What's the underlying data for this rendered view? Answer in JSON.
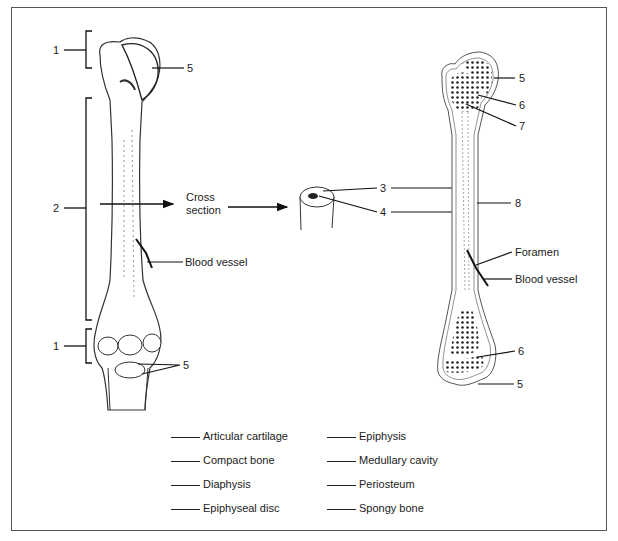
{
  "figure": {
    "left_bone": {
      "labels": {
        "proximal_region": "1",
        "shaft_region": "2",
        "distal_region": "1",
        "cartilage_top": "5",
        "cartilage_bottom": "5",
        "cross_section": "Cross\nsection",
        "cross_section_line1": "Cross",
        "cross_section_line2": "section",
        "blood_vessel": "Blood vessel"
      }
    },
    "cross_section": {
      "labels": {
        "outer": "3",
        "inner": "4"
      }
    },
    "right_bone": {
      "labels": {
        "top_cartilage": "5",
        "top_disc": "6",
        "top_spongy": "7",
        "periosteum": "8",
        "foramen": "Foramen",
        "blood_vessel": "Blood vessel",
        "bottom_disc": "6",
        "bottom_cartilage": "5"
      }
    }
  },
  "key": {
    "left": [
      "Articular cartilage",
      "Compact bone",
      "Diaphysis",
      "Epiphyseal disc"
    ],
    "right": [
      "Epiphysis",
      "Medullary cavity",
      "Periosteum",
      "Spongy bone"
    ]
  }
}
